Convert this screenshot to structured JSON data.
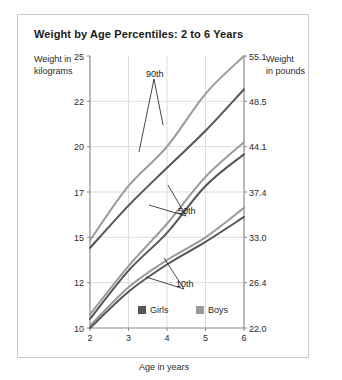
{
  "figure": {
    "title": "Weight by Age Percentiles: 2 to 6 Years",
    "left_axis_title_line1": "Weight in",
    "left_axis_title_line2": "kilograms",
    "right_axis_title_line1": "Weight",
    "right_axis_title_line2": "in pounds",
    "x_axis_title": "Age in years"
  },
  "colors": {
    "girls": "#555555",
    "boys": "#9a9a9a",
    "frame": "#8a8a8a",
    "grid": "#dcdcdc",
    "border": "#c9c9c9",
    "text": "#2b2b2b"
  },
  "legend": {
    "items": [
      {
        "label": "Girls",
        "color": "#555555"
      },
      {
        "label": "Boys",
        "color": "#9a9a9a"
      }
    ]
  },
  "annotations": [
    {
      "label": "90th"
    },
    {
      "label": "50th"
    },
    {
      "label": "10th"
    }
  ],
  "chart_data": {
    "type": "line",
    "title": "Weight by Age Percentiles: 2 to 6 Years",
    "xlabel": "Age in years",
    "ylabel": "Weight in kilograms",
    "ylabel_secondary": "Weight in pounds",
    "xlim": [
      2,
      6
    ],
    "ylim": [
      10,
      25
    ],
    "grid": true,
    "legend_position": "bottom-center",
    "x_ticks": [
      2,
      3,
      4,
      5,
      6
    ],
    "x_ticklabels": [
      "2",
      "3",
      "4",
      "5",
      "6"
    ],
    "y_ticks_kg": [
      10,
      12,
      15,
      17,
      20,
      22,
      25
    ],
    "y_ticklabels_kg": [
      "10",
      "12",
      "15",
      "17",
      "20",
      "22",
      "25"
    ],
    "y_ticks_lb": [
      22.0,
      26.4,
      33.0,
      37.4,
      44.1,
      48.5,
      55.1
    ],
    "y_ticklabels_lb": [
      "22.0",
      "26.4",
      "33.0",
      "37.4",
      "44.1",
      "48.5",
      "55.1"
    ],
    "x": [
      2,
      3,
      4,
      5,
      6
    ],
    "series": [
      {
        "name": "Boys 90th",
        "sex": "Boys",
        "percentile": "90th",
        "color": "#9a9a9a",
        "values": [
          14.8,
          17.4,
          20.0,
          22.5,
          25.0
        ]
      },
      {
        "name": "Girls 90th",
        "sex": "Girls",
        "percentile": "90th",
        "color": "#555555",
        "values": [
          14.3,
          16.4,
          18.6,
          20.7,
          22.8
        ]
      },
      {
        "name": "Boys 50th",
        "sex": "Boys",
        "percentile": "50th",
        "color": "#9a9a9a",
        "values": [
          10.6,
          13.1,
          15.6,
          18.0,
          20.2
        ]
      },
      {
        "name": "Girls 50th",
        "sex": "Girls",
        "percentile": "50th",
        "color": "#555555",
        "values": [
          10.4,
          12.8,
          15.2,
          17.4,
          19.5
        ]
      },
      {
        "name": "Boys 10th",
        "sex": "Boys",
        "percentile": "10th",
        "color": "#9a9a9a",
        "values": [
          10.1,
          11.8,
          13.5,
          15.0,
          16.3
        ]
      },
      {
        "name": "Girls 10th",
        "sex": "Girls",
        "percentile": "10th",
        "color": "#555555",
        "values": [
          10.0,
          11.6,
          13.2,
          14.7,
          15.9
        ]
      }
    ]
  }
}
